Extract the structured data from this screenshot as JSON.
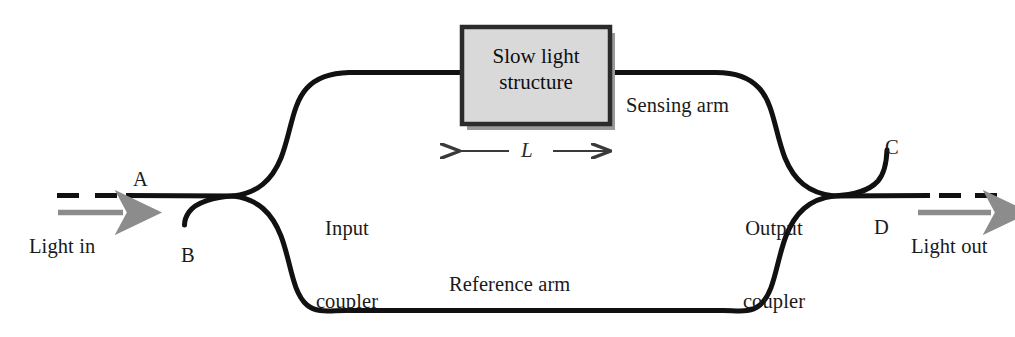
{
  "figure": {
    "type": "optical-interferometer-schematic"
  },
  "colors": {
    "waveguide": "#111111",
    "arrow_gray": "#8c8c8c",
    "box_fill": "#d9d9d9",
    "box_border": "#2b2b2b",
    "box_shadow": "#9a9a9a",
    "text": "#1a1a1a",
    "background": "#ffffff"
  },
  "component_box": {
    "line1": "Slow light",
    "line2": "structure"
  },
  "length_marker": {
    "symbol": "L",
    "left_arrow": "←",
    "right_arrow": "→"
  },
  "labels": {
    "input_coupler_line1": "Input",
    "input_coupler_line2": "coupler",
    "output_coupler_line1": "Output",
    "output_coupler_line2": "coupler",
    "sensing_arm": "Sensing arm",
    "reference_arm": "Reference arm",
    "light_in": "Light in",
    "light_out": "Light out"
  },
  "ports": {
    "a": "A",
    "b": "B",
    "c": "C",
    "d": "D"
  },
  "icons": {
    "light_in_arrow": "right-arrow-icon",
    "light_out_arrow": "right-arrow-icon",
    "length_left_arrow": "left-arrow-icon",
    "length_right_arrow": "right-arrow-icon"
  }
}
